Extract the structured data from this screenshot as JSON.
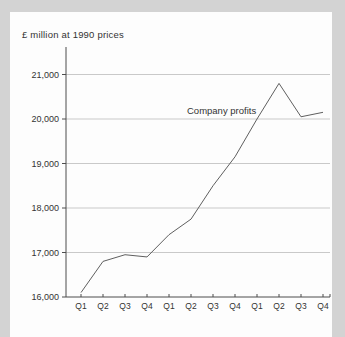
{
  "colors": {
    "background": "#d3d3d3",
    "panel": "#fdfdfd",
    "grid": "#c9c9c9",
    "axis": "#4d4d4d",
    "line": "#5f5f5f",
    "text": "#333333"
  },
  "chart_data": {
    "type": "line",
    "title": "£ million at 1990 prices",
    "categories": [
      "Q1",
      "Q2",
      "Q3",
      "Q4",
      "Q1",
      "Q2",
      "Q3",
      "Q4",
      "Q1",
      "Q2",
      "Q3",
      "Q4"
    ],
    "series": [
      {
        "name": "Company profits",
        "values": [
          16100,
          16800,
          16950,
          16900,
          17400,
          17750,
          18500,
          19150,
          20000,
          20800,
          20050,
          20150
        ]
      }
    ],
    "xlabel": "",
    "ylabel": "£ million at 1990 prices",
    "ylim": [
      16000,
      21000
    ],
    "ytick_interval": 1000,
    "ytick_values": [
      16000,
      17000,
      18000,
      19000,
      20000,
      21000
    ],
    "ytick_labels": [
      "16,000",
      "17,000",
      "18,000",
      "19,000",
      "20,000",
      "21,000"
    ],
    "grid": "horizontal",
    "legend_position": "none",
    "annotation": {
      "text": "Company profits"
    }
  }
}
